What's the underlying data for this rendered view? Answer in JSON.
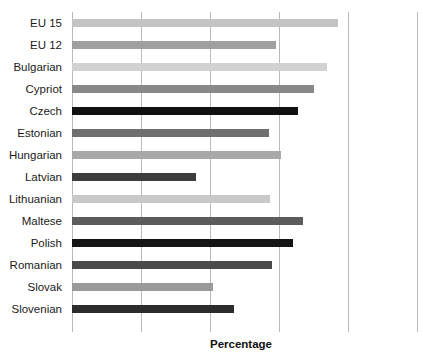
{
  "chart_data": {
    "type": "bar",
    "orientation": "horizontal",
    "title": "",
    "xlabel": "Percentage",
    "ylabel": "",
    "categories": [
      "EU 15",
      "EU 12",
      "Bulgarian",
      "Cypriot",
      "Czech",
      "Estonian",
      "Hungarian",
      "Latvian",
      "Lithuanian",
      "Maltese",
      "Polish",
      "Romanian",
      "Slovak",
      "Slovenian"
    ],
    "values": [
      77,
      59,
      74,
      70,
      65.5,
      57,
      60.5,
      36,
      57.5,
      67,
      64,
      58,
      41,
      47
    ],
    "bar_colors": [
      "#c3c3c3",
      "#a0a0a0",
      "#d2d2d2",
      "#888888",
      "#111111",
      "#6f6f6f",
      "#a8a8a8",
      "#3d3d3d",
      "#c9c9c9",
      "#5c5c5c",
      "#151515",
      "#4a4a4a",
      "#9a9a9a",
      "#2c2c2c"
    ],
    "xlim": [
      0,
      100
    ],
    "xticks": [
      0,
      20,
      40,
      60,
      80,
      100
    ],
    "xtick_labels": [
      "",
      "",
      "",
      "",
      "",
      ""
    ],
    "grid": true,
    "grid_axis": "x",
    "grid_color": "#b9b9b9",
    "legend": "none",
    "background_color": "#ffffff",
    "bar_thickness_px": 8,
    "row_pitch_px": 22
  },
  "axis": {
    "xlabel_text": "Percentage"
  }
}
